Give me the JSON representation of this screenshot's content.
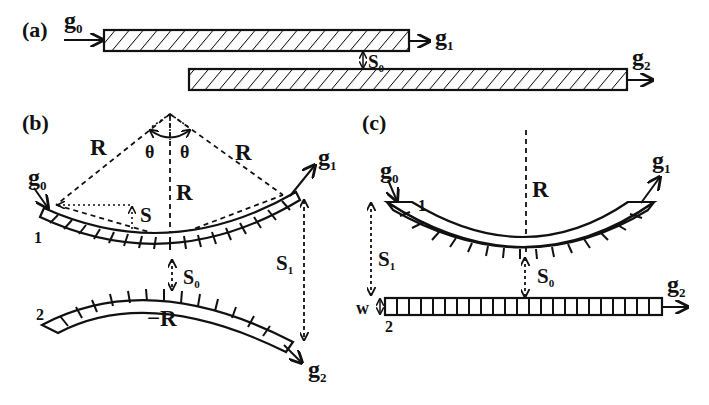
{
  "panels": {
    "a": {
      "label": "(a)",
      "input_wave": {
        "base": "g",
        "sub": "0"
      },
      "output_wave_1": {
        "base": "g",
        "sub": "1"
      },
      "output_wave_2": {
        "base": "g",
        "sub": "2"
      },
      "gap": {
        "base": "S",
        "sub": "0"
      }
    },
    "b": {
      "label": "(b)",
      "radius_left": "R",
      "radius_center": "R",
      "radius_right": "R",
      "theta_left": "θ",
      "theta_right": "θ",
      "input_wave": {
        "base": "g",
        "sub": "0"
      },
      "output_wave_1": {
        "base": "g",
        "sub": "1"
      },
      "output_wave_2": {
        "base": "g",
        "sub": "2"
      },
      "sag": "S",
      "gap": {
        "base": "S",
        "sub": "0"
      },
      "end_gap": {
        "base": "S",
        "sub": "1"
      },
      "layer1": "1",
      "layer2": "2",
      "neg_radius": "−R"
    },
    "c": {
      "label": "(c)",
      "radius": "R",
      "input_wave": {
        "base": "g",
        "sub": "0"
      },
      "output_wave_1": {
        "base": "g",
        "sub": "1"
      },
      "output_wave_2": {
        "base": "g",
        "sub": "2"
      },
      "gap": {
        "base": "S",
        "sub": "0"
      },
      "end_gap": {
        "base": "S",
        "sub": "1"
      },
      "layer1": "1",
      "layer2": "2",
      "width": "w"
    }
  },
  "colors": {
    "ink": "#111111",
    "background": "#ffffff"
  }
}
